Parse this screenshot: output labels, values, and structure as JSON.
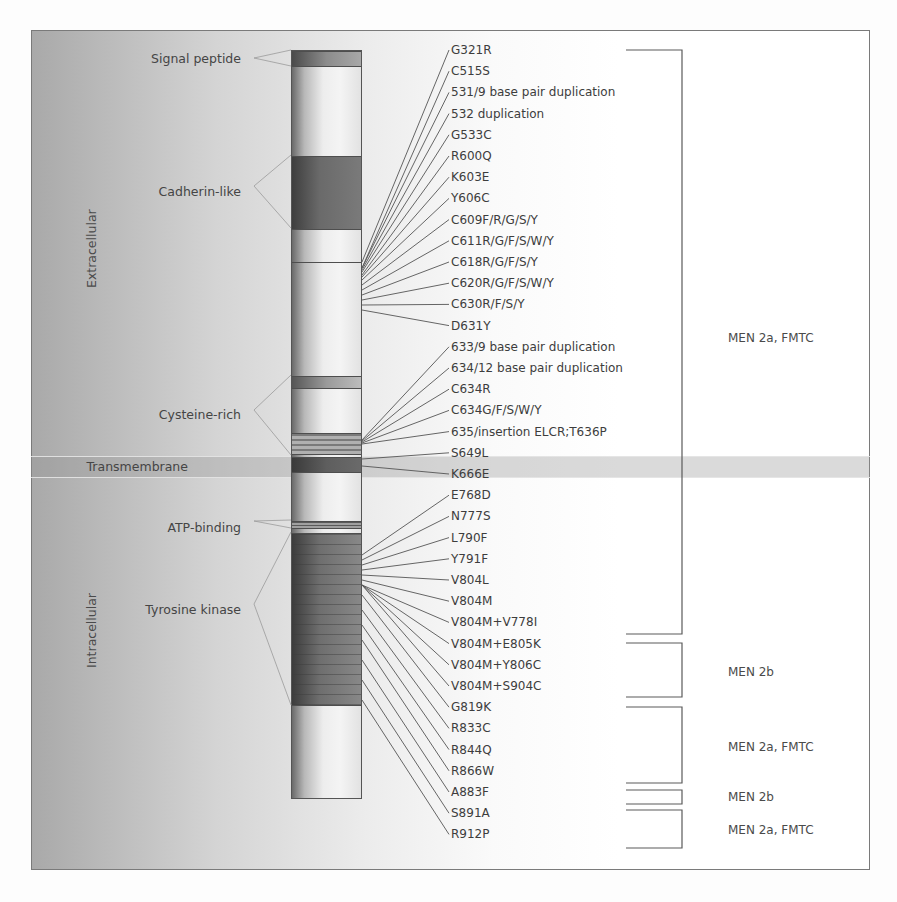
{
  "figure": {
    "regions": {
      "extracellular": "Extracellular",
      "intracellular": "Intracellular"
    },
    "domains": [
      {
        "label": "Signal peptide",
        "y": 58
      },
      {
        "label": "Cadherin-like",
        "y": 186
      },
      {
        "label": "Cysteine-rich",
        "y": 410
      },
      {
        "label": "Transmembrane",
        "y": 460
      },
      {
        "label": "ATP-binding",
        "y": 521
      },
      {
        "label": "Tyrosine kinase",
        "y": 604
      }
    ],
    "mutations": [
      "G321R",
      "C515S",
      "531/9 base pair duplication",
      "532 duplication",
      "G533C",
      "R600Q",
      "K603E",
      "Y606C",
      "C609F/R/G/S/Y",
      "C611R/G/F/S/W/Y",
      "C618R/G/F/S/Y",
      "C620R/G/F/S/W/Y",
      "C630R/F/S/Y",
      "D631Y",
      "633/9 base pair duplication",
      "634/12 base pair duplication",
      "C634R",
      "C634G/F/S/W/Y",
      "635/insertion ELCR;T636P",
      "S649L",
      "K666E",
      "E768D",
      "N777S",
      "L790F",
      "Y791F",
      "V804L",
      "V804M",
      "V804M+V778I",
      "V804M+E805K",
      "V804M+Y806C",
      "V804M+S904C",
      "G819K",
      "R833C",
      "R844Q",
      "R866W",
      "A883F",
      "S891A",
      "R912P"
    ],
    "syndrome_groups": [
      {
        "label": "MEN 2a, FMTC",
        "from": "G321R",
        "to": "V804M+V778I"
      },
      {
        "label": "MEN 2b",
        "from": "V804M+E805K",
        "to": "V804M+S904C"
      },
      {
        "label": "MEN 2a, FMTC",
        "from": "G819K",
        "to": "R866W"
      },
      {
        "label": "MEN 2b",
        "from": "A883F",
        "to": "A883F"
      },
      {
        "label": "MEN 2a, FMTC",
        "from": "S891A",
        "to": "R912P"
      }
    ]
  }
}
